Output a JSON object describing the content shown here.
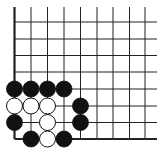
{
  "diagram": {
    "type": "go-board-corner",
    "corner": "bottom-left",
    "colors": {
      "background": "#ffffff",
      "line": "#222222",
      "black_stone": "#111111",
      "white_stone": "#ffffff",
      "stone_outline": "#111111"
    },
    "grid": {
      "columns_x": [
        14.5,
        31,
        47.5,
        64,
        80.5,
        97,
        113,
        129.5,
        145
      ],
      "rows_y": [
        22,
        39,
        55.5,
        72,
        89,
        106,
        122.5,
        139
      ],
      "top_extent": 7,
      "right_extent": 157,
      "edge_left_col": 0,
      "edge_bottom_row": 7,
      "stone_radius": 8
    },
    "stones": [
      {
        "color": "black",
        "col": 0,
        "row": 4
      },
      {
        "color": "black",
        "col": 1,
        "row": 4
      },
      {
        "color": "black",
        "col": 2,
        "row": 4
      },
      {
        "color": "black",
        "col": 3,
        "row": 4
      },
      {
        "color": "white",
        "col": 0,
        "row": 5
      },
      {
        "color": "white",
        "col": 1,
        "row": 5
      },
      {
        "color": "white",
        "col": 2,
        "row": 5
      },
      {
        "color": "black",
        "col": 4,
        "row": 5
      },
      {
        "color": "black",
        "col": 0,
        "row": 6
      },
      {
        "color": "white",
        "col": 2,
        "row": 6
      },
      {
        "color": "black",
        "col": 4,
        "row": 6
      },
      {
        "color": "black",
        "col": 1,
        "row": 7
      },
      {
        "color": "white",
        "col": 2,
        "row": 7
      },
      {
        "color": "black",
        "col": 3,
        "row": 7
      }
    ]
  }
}
